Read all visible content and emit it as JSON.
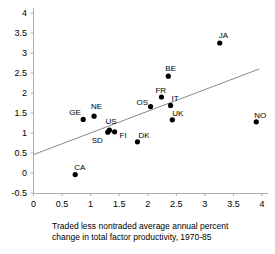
{
  "chart_data": {
    "type": "scatter",
    "title": "",
    "xlabel": "Traded less nontraded average annual  percent change in total  factor productivity, 1970-85",
    "ylabel": "",
    "xlim": [
      0,
      4
    ],
    "ylim": [
      -0.5,
      4
    ],
    "xticks": [
      "0",
      "0.5",
      "1",
      "1.5",
      "2",
      "2.5",
      "3",
      "3.5",
      "4"
    ],
    "yticks": [
      "4",
      "3.5",
      "3",
      "2.5",
      "2",
      "1.5",
      "1",
      "0.5",
      "0",
      "-0.5"
    ],
    "grid": false,
    "legend": "none",
    "points": [
      {
        "label": "CA",
        "x": 0.73,
        "y": -0.04,
        "label_dx": -1,
        "label_dy": -12
      },
      {
        "label": "GE",
        "x": 0.87,
        "y": 1.34,
        "label_dx": -14,
        "label_dy": -11
      },
      {
        "label": "NE",
        "x": 1.06,
        "y": 1.42,
        "label_dx": -3,
        "label_dy": -14
      },
      {
        "label": "SD",
        "x": 1.3,
        "y": 1.02,
        "label_dx": -16,
        "label_dy": 4
      },
      {
        "label": "US",
        "x": 1.33,
        "y": 1.07,
        "label_dx": -4,
        "label_dy": -13
      },
      {
        "label": "FI",
        "x": 1.42,
        "y": 1.03,
        "label_dx": 5,
        "label_dy": -1
      },
      {
        "label": "DK",
        "x": 1.82,
        "y": 0.78,
        "label_dx": 1,
        "label_dy": -11
      },
      {
        "label": "OS",
        "x": 2.05,
        "y": 1.66,
        "label_dx": -14,
        "label_dy": -9
      },
      {
        "label": "FR",
        "x": 2.24,
        "y": 1.9,
        "label_dx": -6,
        "label_dy": -11
      },
      {
        "label": "BE",
        "x": 2.36,
        "y": 2.42,
        "label_dx": -3,
        "label_dy": -12
      },
      {
        "label": "IT",
        "x": 2.4,
        "y": 1.69,
        "label_dx": 1,
        "label_dy": -11
      },
      {
        "label": "UK",
        "x": 2.43,
        "y": 1.33,
        "label_dx": 0,
        "label_dy": -11
      },
      {
        "label": "JA",
        "x": 3.26,
        "y": 3.25,
        "label_dx": -1,
        "label_dy": -12
      },
      {
        "label": "NO",
        "x": 3.9,
        "y": 1.28,
        "label_dx": -2,
        "label_dy": -11
      }
    ],
    "trendline": {
      "x0": 0.0,
      "y0": 0.46,
      "x1": 3.95,
      "y1": 2.6
    }
  },
  "axes": {
    "y_axis_name": "y-axis",
    "x_axis_name": "x-axis"
  },
  "caption": {
    "line1": "Traded less nontraded average annual  percent",
    "line2": "change in total  factor productivity, 1970-85"
  }
}
